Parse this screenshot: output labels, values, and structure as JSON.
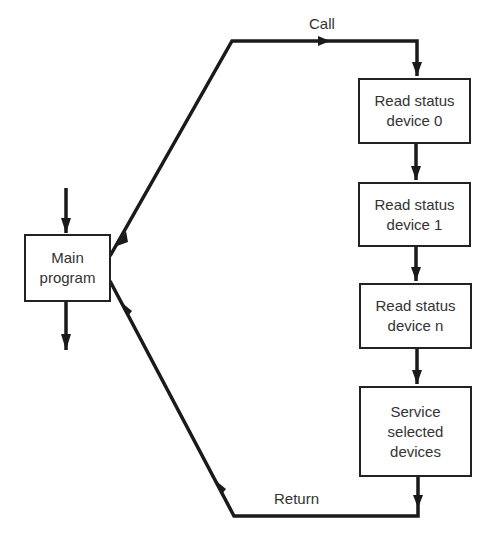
{
  "diagram": {
    "type": "flowchart",
    "title": "",
    "main": {
      "lines": [
        "Main",
        "program"
      ]
    },
    "subroutine_steps": [
      {
        "id": "read0",
        "lines": [
          "Read status",
          "device 0"
        ]
      },
      {
        "id": "read1",
        "lines": [
          "Read status",
          "device 1"
        ]
      },
      {
        "id": "readn",
        "lines": [
          "Read status",
          "device n"
        ]
      },
      {
        "id": "service",
        "lines": [
          "Service",
          "selected",
          "devices"
        ]
      }
    ],
    "edges": [
      {
        "from": "main",
        "to": "read0",
        "label": "Call"
      },
      {
        "from": "read0",
        "to": "read1",
        "label": ""
      },
      {
        "from": "read1",
        "to": "readn",
        "label": ""
      },
      {
        "from": "readn",
        "to": "service",
        "label": ""
      },
      {
        "from": "service",
        "to": "main",
        "label": "Return"
      }
    ],
    "labels": {
      "call": "Call",
      "return": "Return"
    },
    "colors": {
      "line": "#1a1a1a",
      "text": "#333333",
      "background": "#ffffff"
    }
  }
}
